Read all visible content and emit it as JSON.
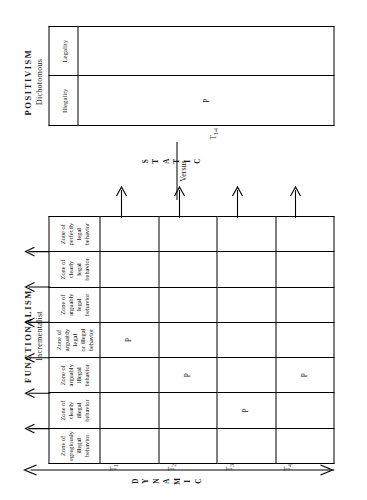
{
  "figure": {
    "orientation": "rotated-90-ccw",
    "left_panel": {
      "title": "FUNCTIONALISM",
      "subtitle": "Incrementalist",
      "axis_label": "DYNAMIC",
      "axis_letters": [
        "D",
        "Y",
        "N",
        "A",
        "M",
        "I",
        "C"
      ],
      "columns": [
        {
          "id": "egregiously-illegal",
          "label": "Zone of\negregiously\nillegal\nbehavior",
          "lines": [
            "Zone of",
            "egregiously",
            "illegal",
            "behavior"
          ]
        },
        {
          "id": "clearly-illegal",
          "label": "Zone of\nclearly\nillegal\nbehavior",
          "lines": [
            "Zone of",
            "clearly",
            "illegal",
            "behavior"
          ]
        },
        {
          "id": "arguably-illegal",
          "label": "Zone of\narguably\nillegal\nbehavior",
          "lines": [
            "Zone of",
            "arguably",
            "illegal",
            "behavior"
          ]
        },
        {
          "id": "arguably-legal-or-illegal",
          "label": "Zone of\narguably legal\nor illegal\nbehavior",
          "lines": [
            "Zone of",
            "arguably legal",
            "or illegal",
            "behavior"
          ]
        },
        {
          "id": "arguably-legal",
          "label": "Zone of\narguably\nlegal\nbehavior",
          "lines": [
            "Zone of",
            "arguably",
            "legal",
            "behavior"
          ]
        },
        {
          "id": "clearly-legal",
          "label": "Zone of\nclearly\nlegal\nbehavior",
          "lines": [
            "Zone of",
            "clearly",
            "legal",
            "behavior"
          ]
        },
        {
          "id": "perfectly-legal",
          "label": "Zone of\nperfectly\nlegal\nbehavior",
          "lines": [
            "Zone of",
            "perfectly",
            "legal",
            "behavior"
          ]
        }
      ],
      "rows": [
        {
          "id": "T1",
          "label": "T",
          "sub": "1",
          "marker_column": 3
        },
        {
          "id": "T2",
          "label": "T",
          "sub": "2",
          "marker_column": 2
        },
        {
          "id": "T3",
          "label": "T",
          "sub": "3",
          "marker_column": 1
        },
        {
          "id": "T4",
          "label": "T",
          "sub": "4",
          "marker_column": 2
        }
      ],
      "marker_symbol": "P"
    },
    "separator": {
      "label": "Versus"
    },
    "right_panel": {
      "title": "POSITIVISM",
      "subtitle": "Dichotomous",
      "axis_label": "STATIC",
      "axis_letters": [
        "S",
        "T",
        "A",
        "T",
        "I",
        "C"
      ],
      "columns": [
        {
          "id": "illegality",
          "label": "Illegality"
        },
        {
          "id": "legality",
          "label": "Legality"
        }
      ],
      "rows": [
        {
          "id": "T1-4",
          "label": "T",
          "sub": "1-4",
          "marker_column": 0
        }
      ],
      "marker_symbol": "P"
    },
    "colors": {
      "ink": "#1a1a1a",
      "rule": "#000000",
      "background": "#ffffff"
    }
  }
}
